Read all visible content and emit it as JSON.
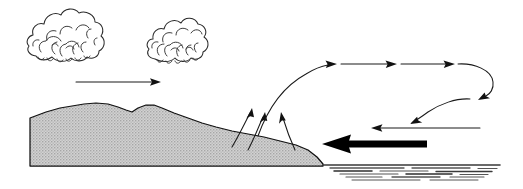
{
  "figure": {
    "name": "sea-breeze-circulation-diagram",
    "width": 523,
    "height": 189,
    "background_color": "#ffffff",
    "ink_color": "#1a1a1a"
  },
  "colors": {
    "ink": "#1a1a1a",
    "land_fill": "#c8c8c8",
    "land_outline": "#111111",
    "sea_line": "#555555",
    "cloud_line": "#2a2a2a",
    "thick_arrow": "#000000",
    "paper": "#ffffff"
  },
  "clouds": [
    {
      "id": "cloud-left",
      "label": "cumulus-cloud-left",
      "cx": 66,
      "cy": 36,
      "width": 76,
      "height": 54
    },
    {
      "id": "cloud-right",
      "label": "cumulus-cloud-right",
      "cx": 183,
      "cy": 40,
      "width": 68,
      "height": 48
    }
  ],
  "terrain": {
    "id": "land-mass",
    "label": "land-terrain-profile",
    "fill": "#c8c8c8",
    "peak_x": 95,
    "peak_y": 104,
    "base_y": 166,
    "coast_x": 325,
    "start_x": 30
  },
  "sea": {
    "id": "sea-surface",
    "label": "sea-water-surface",
    "start_x": 322,
    "end_x": 503,
    "top_y": 164,
    "line_count": 14
  },
  "arrows": [
    {
      "id": "arrow-land-wind",
      "label": "land-level-horizontal-arrow",
      "kind": "thin",
      "direction": "right",
      "x1": 76,
      "y1": 82,
      "x2": 161,
      "y2": 82
    },
    {
      "id": "arrow-updraft-left",
      "label": "updraft-arrow-left",
      "kind": "thin-curved",
      "direction": "up-right"
    },
    {
      "id": "arrow-updraft-middle",
      "label": "updraft-arrow-middle",
      "kind": "thin-curved",
      "direction": "up-right"
    },
    {
      "id": "arrow-updraft-right",
      "label": "updraft-arrow-right",
      "kind": "thin-curved",
      "direction": "up-left"
    },
    {
      "id": "arrow-upper-outflow",
      "label": "upper-level-outflow-arrow",
      "kind": "thin-curved",
      "direction": "right",
      "arrowhead_count": 3
    },
    {
      "id": "arrow-descending-right",
      "label": "descending-hook-arrow-right-edge",
      "kind": "thin-curved",
      "direction": "down-left"
    },
    {
      "id": "arrow-subsidence",
      "label": "subsidence-arrow-over-sea",
      "kind": "thin-curved",
      "direction": "down-left"
    },
    {
      "id": "arrow-return-flow",
      "label": "return-flow-arrow-thin",
      "kind": "thin",
      "direction": "left",
      "x1": 480,
      "y1": 128,
      "x2": 371,
      "y2": 128
    },
    {
      "id": "arrow-sea-breeze",
      "label": "sea-breeze-thick-arrow",
      "kind": "thick",
      "direction": "left",
      "x1": 427,
      "y1": 144,
      "x2": 322,
      "y2": 144
    }
  ]
}
